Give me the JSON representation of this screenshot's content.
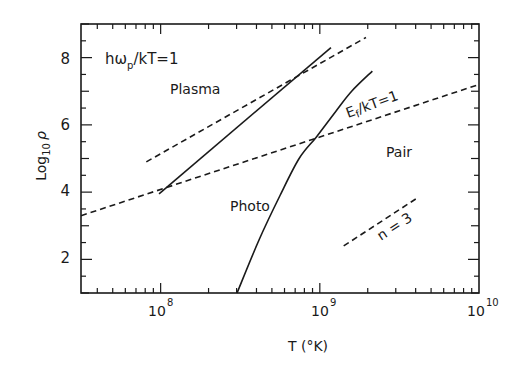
{
  "chart_data": {
    "type": "line",
    "title": "",
    "xlabel": "T (°K)",
    "ylabel": "Log10 ρ",
    "xscale": "log",
    "xlim": [
      31600000.0,
      10000000000.0
    ],
    "ylim": [
      1,
      9
    ],
    "x_ticks": [
      {
        "value": 100000000.0,
        "label": "10",
        "exp": "8"
      },
      {
        "value": 1000000000.0,
        "label": "10",
        "exp": "9"
      },
      {
        "value": 10000000000.0,
        "label": "10",
        "exp": "10"
      }
    ],
    "y_ticks": [
      2,
      4,
      6,
      8
    ],
    "grid": false,
    "series": [
      {
        "name": "Plasma/Photo boundary",
        "style": "solid",
        "points": [
          [
            7.99,
            3.95
          ],
          [
            9.07,
            8.3
          ]
        ]
      },
      {
        "name": "hω_p/kT=1 asymptote",
        "style": "dashed",
        "points": [
          [
            7.91,
            4.9
          ],
          [
            9.29,
            8.6
          ]
        ]
      },
      {
        "name": "Ef/kT=1",
        "style": "dashed",
        "points": [
          [
            7.5,
            3.3
          ],
          [
            10.0,
            7.2
          ]
        ]
      },
      {
        "name": "Photo/Pair boundary",
        "style": "solid",
        "points": [
          [
            8.48,
            1.0
          ],
          [
            8.62,
            2.6
          ],
          [
            8.75,
            3.9
          ],
          [
            8.87,
            5.0
          ],
          [
            8.98,
            5.65
          ],
          [
            9.1,
            6.4
          ],
          [
            9.2,
            7.0
          ],
          [
            9.33,
            7.6
          ]
        ]
      },
      {
        "name": "n=3 slope",
        "style": "dashed",
        "points": [
          [
            9.15,
            2.4
          ],
          [
            9.62,
            3.85
          ]
        ]
      }
    ],
    "annotations": [
      {
        "text": "ħω",
        "sub": "p",
        "tail": "/kT=1",
        "x": 7.6,
        "y": 8.0
      },
      {
        "text": "Plasma",
        "x": 7.96,
        "y": 7.0
      },
      {
        "text": "Ef/kT=1",
        "x": 9.2,
        "y": 6.4,
        "rotate": -20
      },
      {
        "text": "Pair",
        "x": 9.47,
        "y": 5.35
      },
      {
        "text": "Photo",
        "x": 8.28,
        "y": 4.65
      },
      {
        "text": "n = 3",
        "x": 9.43,
        "y": 2.85,
        "rotate": -33
      }
    ]
  },
  "labels": {
    "annot_hw": "hω",
    "annot_hw_sub": "p",
    "annot_hw_tail": "/kT=1",
    "plasma": "Plasma",
    "ef": "E",
    "ef_sub": "f",
    "ef_tail": "/kT=1",
    "pair": "Pair",
    "photo": "Photo",
    "n3": "n = 3",
    "xlabel": "T (°K)",
    "ylabel_log": "Log",
    "ylabel_sub": "10",
    "ylabel_rho": "ρ",
    "ytick_2": "2",
    "ytick_4": "4",
    "ytick_6": "6",
    "ytick_8": "8",
    "xtick_base": "10",
    "xtick_8": "8",
    "xtick_9": "9",
    "xtick_10": "10"
  }
}
